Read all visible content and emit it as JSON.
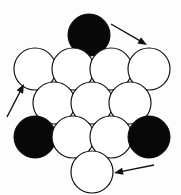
{
  "figure": {
    "width": 181,
    "height": 195,
    "background_color": "#fdfdfd",
    "colors": {
      "filled_circle": "#080808",
      "empty_circle_fill": "#ffffff",
      "outline": "#141414",
      "arrow": "#101010"
    },
    "counts": {
      "total_circles": 13,
      "filled_circles": 4,
      "empty_circles": 9,
      "arrows": 3
    },
    "radius": 21,
    "rows": [
      {
        "row_index": 0,
        "label": "row-1",
        "circle_count": 1,
        "center_y": 35,
        "circles": [
          {
            "id": "c-r1-1",
            "state": "filled",
            "cx": 89,
            "cy": 35
          }
        ]
      },
      {
        "row_index": 1,
        "label": "row-2",
        "circle_count": 4,
        "center_y": 69,
        "circles": [
          {
            "id": "c-r2-1",
            "state": "empty",
            "cx": 35,
            "cy": 69
          },
          {
            "id": "c-r2-2",
            "state": "empty",
            "cx": 73,
            "cy": 69
          },
          {
            "id": "c-r2-3",
            "state": "empty",
            "cx": 111,
            "cy": 69
          },
          {
            "id": "c-r2-4",
            "state": "empty",
            "cx": 149,
            "cy": 69
          }
        ]
      },
      {
        "row_index": 2,
        "label": "row-3",
        "circle_count": 3,
        "center_y": 103,
        "circles": [
          {
            "id": "c-r3-1",
            "state": "empty",
            "cx": 54,
            "cy": 103
          },
          {
            "id": "c-r3-2",
            "state": "empty",
            "cx": 92,
            "cy": 103
          },
          {
            "id": "c-r3-3",
            "state": "empty",
            "cx": 130,
            "cy": 103
          }
        ]
      },
      {
        "row_index": 3,
        "label": "row-4",
        "circle_count": 4,
        "center_y": 137,
        "circles": [
          {
            "id": "c-r4-1",
            "state": "filled",
            "cx": 35,
            "cy": 137
          },
          {
            "id": "c-r4-2",
            "state": "empty",
            "cx": 73,
            "cy": 137
          },
          {
            "id": "c-r4-3",
            "state": "empty",
            "cx": 111,
            "cy": 137
          },
          {
            "id": "c-r4-4",
            "state": "filled",
            "cx": 149,
            "cy": 137
          }
        ]
      },
      {
        "row_index": 4,
        "label": "row-5",
        "circle_count": 1,
        "center_y": 172,
        "circles": [
          {
            "id": "c-r5-1",
            "state": "empty",
            "cx": 92,
            "cy": 172
          }
        ]
      }
    ],
    "arrows": [
      {
        "id": "arrow-top-right",
        "label": "arrow-pointing-down-right",
        "direction": "down-right",
        "x1": 111,
        "y1": 24,
        "x2": 147,
        "y2": 45,
        "points_at": "c-r2-4"
      },
      {
        "id": "arrow-left",
        "label": "arrow-pointing-up-right",
        "direction": "up-right",
        "x1": 7,
        "y1": 117,
        "x2": 24,
        "y2": 84,
        "points_at": "c-r2-1"
      },
      {
        "id": "arrow-bottom-right",
        "label": "arrow-pointing-left",
        "direction": "left",
        "x1": 154,
        "y1": 165,
        "x2": 114,
        "y2": 173,
        "points_at": "c-r5-1"
      }
    ]
  }
}
